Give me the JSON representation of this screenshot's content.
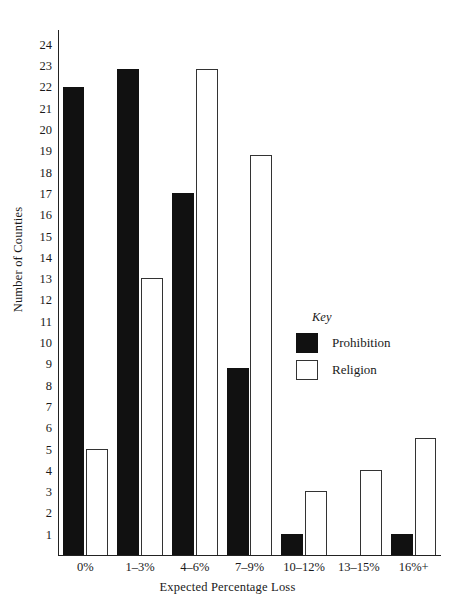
{
  "chart_data": {
    "type": "bar",
    "title": "",
    "xlabel": "Expected Percentage Loss",
    "ylabel": "Number of Counties",
    "categories": [
      "0%",
      "1–3%",
      "4–6%",
      "7–9%",
      "10–12%",
      "13–15%",
      "16%+"
    ],
    "series": [
      {
        "name": "Prohibition",
        "color": "#111111",
        "fill": "solid",
        "values": [
          22,
          22.8,
          17,
          8.8,
          1,
          0,
          1
        ]
      },
      {
        "name": "Religion",
        "color": "#ffffff",
        "fill": "outline",
        "values": [
          5,
          13,
          22.8,
          18.8,
          3,
          4,
          5.5
        ]
      }
    ],
    "ylim": [
      0,
      24.7
    ],
    "yticks": [
      1,
      2,
      3,
      4,
      5,
      6,
      7,
      8,
      9,
      10,
      11,
      12,
      13,
      14,
      15,
      16,
      17,
      18,
      19,
      20,
      21,
      22,
      23,
      24
    ],
    "ytick_labels": [
      "1",
      "2",
      "3",
      "4",
      "5",
      "6",
      "7",
      "8",
      "9",
      "10",
      "11",
      "12",
      "13",
      "14",
      "15",
      "16",
      "17",
      "18",
      "19",
      "20",
      "21",
      "22",
      "23",
      "24"
    ],
    "grid": false,
    "legend_position": "inside-right",
    "legend_title": "Key"
  },
  "legend": {
    "title": "Key",
    "entries": [
      {
        "label": "Prohibition",
        "swatch": "filled-black"
      },
      {
        "label": "Religion",
        "swatch": "outlined-white"
      }
    ]
  },
  "axes": {
    "x_title": "Expected Percentage Loss",
    "y_title": "Number of Counties"
  }
}
